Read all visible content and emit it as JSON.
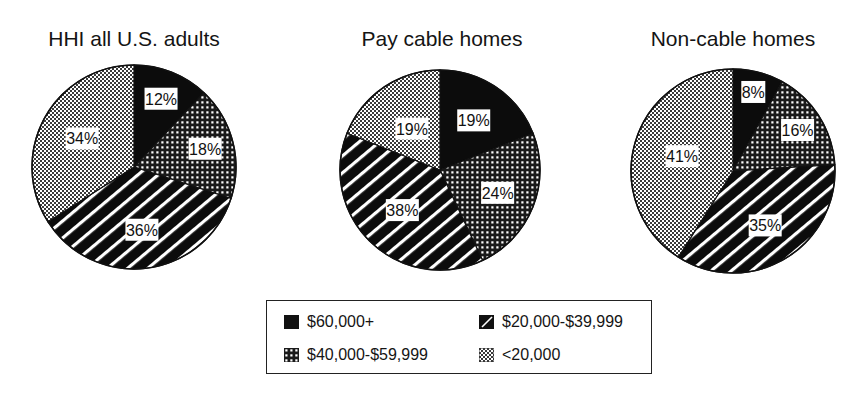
{
  "chart_data": [
    {
      "type": "pie",
      "title": "HHI all U.S. adults",
      "categories": [
        "$60,000+",
        "$40,000-$59,999",
        "$20,000-$39,999",
        "<20,000"
      ],
      "values": [
        12,
        18,
        36,
        34
      ],
      "labels": [
        "12%",
        "18%",
        "36%",
        "34%"
      ]
    },
    {
      "type": "pie",
      "title": "Pay cable homes",
      "categories": [
        "$60,000+",
        "$40,000-$59,999",
        "$20,000-$39,999",
        "<20,000"
      ],
      "values": [
        19,
        24,
        38,
        19
      ],
      "labels": [
        "19%",
        "24%",
        "38%",
        "19%"
      ]
    },
    {
      "type": "pie",
      "title": "Non-cable homes",
      "categories": [
        "$60,000+",
        "$40,000-$59,999",
        "$20,000-$39,999",
        "<20,000"
      ],
      "values": [
        8,
        16,
        35,
        41
      ],
      "labels": [
        "8%",
        "16%",
        "35%",
        "41%"
      ]
    }
  ],
  "legend": {
    "position": "bottom-center",
    "items": [
      {
        "label": "$60,000+",
        "pattern": "solid-black"
      },
      {
        "label": "$20,000-$39,999",
        "pattern": "diagonal-stripes"
      },
      {
        "label": "$40,000-$59,999",
        "pattern": "coarse-dots"
      },
      {
        "label": "<20,000",
        "pattern": "fine-checker"
      }
    ]
  },
  "colors": {
    "ink": "#111111",
    "background": "#ffffff"
  }
}
